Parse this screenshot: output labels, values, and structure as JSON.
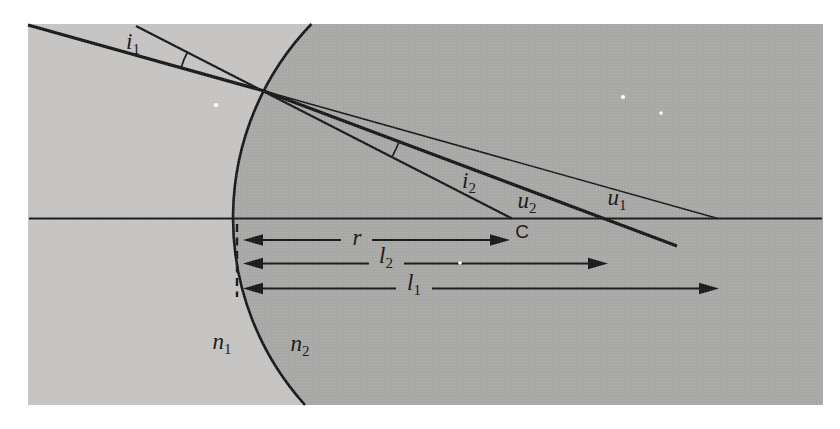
{
  "figure": {
    "kind": "optics-refraction-at-spherical-surface-diagram",
    "labels": {
      "i1": {
        "base": "i",
        "sub": "1"
      },
      "i2": {
        "base": "i",
        "sub": "2"
      },
      "u2": {
        "base": "u",
        "sub": "2"
      },
      "u1": {
        "base": "u",
        "sub": "1"
      },
      "C": {
        "base": "C",
        "sub": ""
      },
      "r": {
        "base": "r",
        "sub": ""
      },
      "l2": {
        "base": "l",
        "sub": "2"
      },
      "l1": {
        "base": "l",
        "sub": "1"
      },
      "n1": {
        "base": "n",
        "sub": "1"
      },
      "n2": {
        "base": "n",
        "sub": "2"
      }
    },
    "colors": {
      "medium1_fill": "#c5c4c2",
      "medium2_fill": "#a8a8a6",
      "line": "#1c1c1c",
      "speckle": "#ffffff",
      "page_background": "#ffffff"
    }
  }
}
